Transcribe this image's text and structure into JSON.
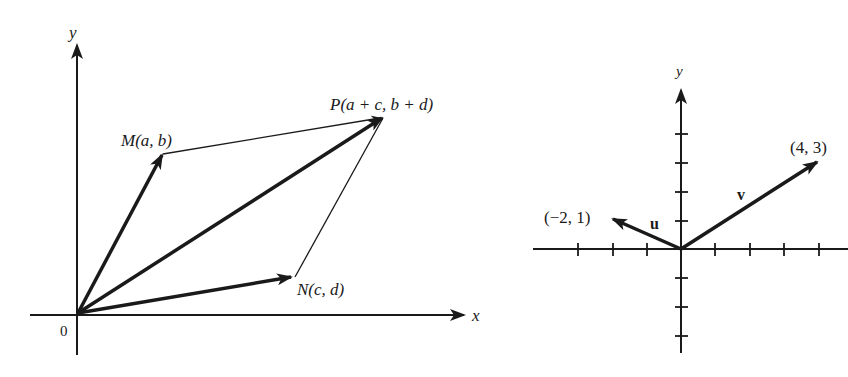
{
  "left_diagram": {
    "axis_x_label": "x",
    "axis_y_label": "y",
    "origin_label": "0",
    "point_M_label": "M(a, b)",
    "point_N_label": "N(c, d)",
    "point_P_label": "P(a + c, b + d)",
    "vectors": [
      {
        "name": "OM",
        "from": "O",
        "to": "M"
      },
      {
        "name": "ON",
        "from": "O",
        "to": "N"
      },
      {
        "name": "OP",
        "from": "O",
        "to": "P"
      }
    ],
    "parallelogram_edges": [
      {
        "from": "M",
        "to": "P"
      },
      {
        "from": "N",
        "to": "P"
      }
    ]
  },
  "right_diagram": {
    "axis_y_label": "y",
    "vector_u_label": "u",
    "vector_v_label": "v",
    "point_u_label": "(−2, 1)",
    "point_v_label": "(4, 3)",
    "vectors": [
      {
        "name": "u",
        "x": -2,
        "y": 1
      },
      {
        "name": "v",
        "x": 4,
        "y": 3
      }
    ],
    "x_ticks_left": 3,
    "x_ticks_right": 4,
    "y_ticks_up": 4,
    "y_ticks_down": 3
  },
  "colors": {
    "ink": "#1a1a1a",
    "background": "#ffffff"
  }
}
